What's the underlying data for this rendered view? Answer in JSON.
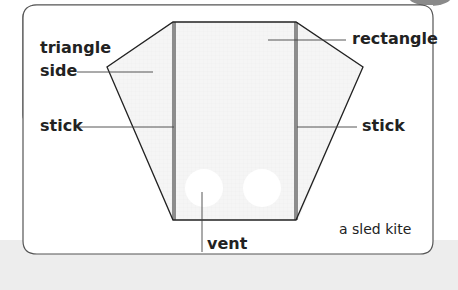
{
  "diagram": {
    "title": "a sled kite",
    "labels": {
      "triangle_side_line1": "triangle",
      "triangle_side_line2": "side",
      "rectangle": "rectangle",
      "stick_left": "stick",
      "stick_right": "stick",
      "vent": "vent"
    },
    "colors": {
      "kite_fill": "#f4f4f4",
      "outline": "#222222",
      "stick": "#8c8c8c",
      "card_border": "#555555",
      "background_band": "#ededed"
    }
  }
}
